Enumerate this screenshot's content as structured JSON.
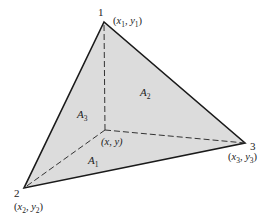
{
  "diagram": {
    "type": "triangle-area-coordinates",
    "colors": {
      "fill": "#dcdcdc",
      "edge": "#1a1a1a",
      "dashed": "#333333",
      "text": "#222222"
    },
    "vertices": [
      {
        "id": "1",
        "label": "1",
        "coord_var": "x",
        "coord_sub": "1",
        "coord_var2": "y",
        "coord_sub2": "1",
        "x": 104,
        "y": 22
      },
      {
        "id": "2",
        "label": "2",
        "coord_var": "x",
        "coord_sub": "2",
        "coord_var2": "y",
        "coord_sub2": "2",
        "x": 24,
        "y": 188
      },
      {
        "id": "3",
        "label": "3",
        "coord_var": "x",
        "coord_sub": "3",
        "coord_var2": "y",
        "coord_sub2": "3",
        "x": 245,
        "y": 143
      }
    ],
    "interior_point": {
      "label": "(x, y)",
      "x": 105,
      "y": 130
    },
    "areas": [
      {
        "id": "A1",
        "base": "A",
        "sub": "1"
      },
      {
        "id": "A2",
        "base": "A",
        "sub": "2"
      },
      {
        "id": "A3",
        "base": "A",
        "sub": "3"
      }
    ]
  }
}
